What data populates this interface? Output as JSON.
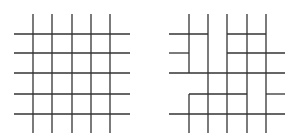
{
  "diagrams": [
    {
      "name": "complete-grid",
      "description": "5x5 grid of full crossing lines",
      "segments": [
        [
          33,
          14,
          33,
          133
        ],
        [
          52,
          14,
          52,
          133
        ],
        [
          72,
          14,
          72,
          133
        ],
        [
          91,
          14,
          91,
          133
        ],
        [
          110,
          14,
          110,
          133
        ],
        [
          14,
          34,
          130,
          34
        ],
        [
          14,
          53,
          130,
          53
        ],
        [
          14,
          73,
          130,
          73
        ],
        [
          14,
          94,
          130,
          94
        ],
        [
          14,
          114,
          130,
          114
        ]
      ]
    },
    {
      "name": "modified-grid",
      "description": "Grid with some line segments removed",
      "segments": [
        [
          189,
          14,
          189,
          73
        ],
        [
          189,
          94,
          189,
          133
        ],
        [
          208,
          14,
          208,
          133
        ],
        [
          227,
          14,
          227,
          133
        ],
        [
          247,
          14,
          247,
          133
        ],
        [
          266,
          14,
          266,
          133
        ],
        [
          169,
          34,
          208,
          34
        ],
        [
          227,
          34,
          266,
          34
        ],
        [
          169,
          53,
          189,
          53
        ],
        [
          227,
          53,
          285,
          53
        ],
        [
          169,
          73,
          285,
          73
        ],
        [
          189,
          94,
          247,
          94
        ],
        [
          266,
          94,
          285,
          94
        ],
        [
          169,
          114,
          285,
          114
        ]
      ]
    }
  ],
  "colors": {
    "line": "#333333",
    "background": "#ffffff"
  }
}
